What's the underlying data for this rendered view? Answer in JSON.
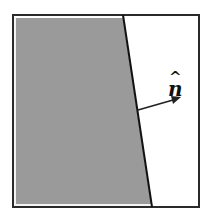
{
  "diagram": {
    "title": "",
    "normal_label": "n",
    "normal_hat": "^",
    "colors": {
      "fill": "#9a9a9a",
      "border": "#2a2a2a",
      "background": "#ffffff"
    }
  }
}
